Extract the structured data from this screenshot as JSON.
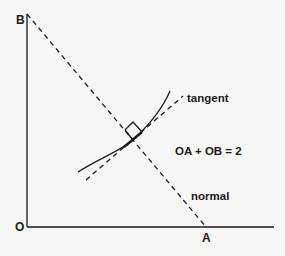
{
  "diagram": {
    "labels": {
      "origin": "O",
      "point_a": "A",
      "point_b": "B",
      "tangent": "tangent",
      "normal": "normal",
      "equation": "OA + OB = 2"
    },
    "colors": {
      "ink": "#1a1a1a",
      "background": "#f7f7f5"
    },
    "elements": [
      {
        "id": "y-axis",
        "type": "solid-line",
        "from": "O",
        "to": "B"
      },
      {
        "id": "x-axis",
        "type": "solid-line",
        "from": "O",
        "to": "beyond A"
      },
      {
        "id": "normal-line",
        "type": "dashed-line",
        "from": "B",
        "to": "A",
        "label": "normal"
      },
      {
        "id": "tangent-line",
        "type": "dashed-line",
        "label": "tangent",
        "perpendicular_to": "normal-line"
      },
      {
        "id": "curve",
        "type": "solid-curve",
        "touches": "tangent-line"
      },
      {
        "id": "right-angle-marker",
        "type": "square",
        "at": "intersection of normal and tangent"
      }
    ]
  }
}
